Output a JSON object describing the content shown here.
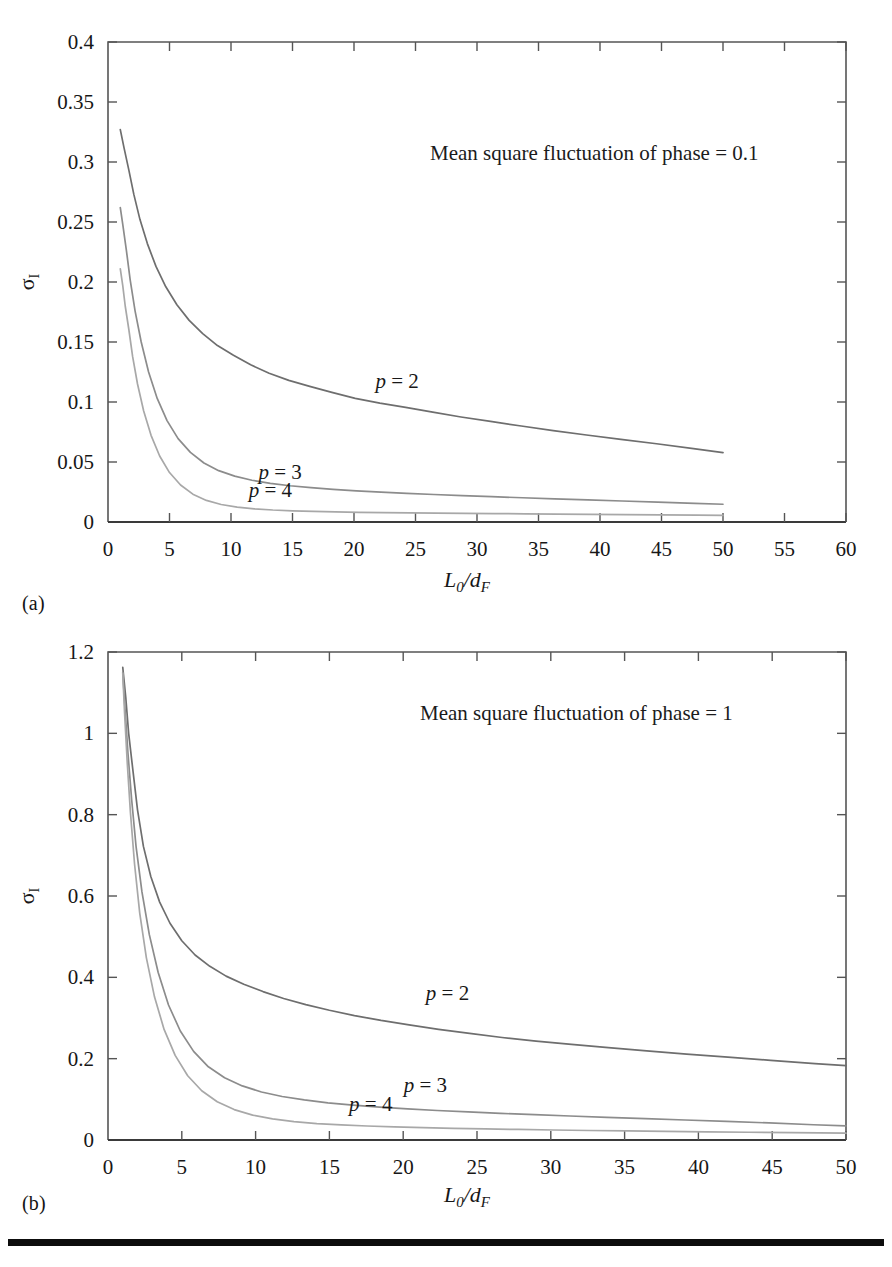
{
  "figure": {
    "panels": [
      {
        "caption": "(a)",
        "annotation": "Mean square fluctuation of phase = 0.1",
        "ylabel": "σ",
        "ylabel_sub": "I",
        "xlabel_main": "L",
        "xlabel_main_sub": "0",
        "xlabel_div": "/",
        "xlabel_den": "d",
        "xlabel_den_sub": "F",
        "series_labels": [
          "p = 2",
          "p = 3",
          "p = 4"
        ]
      },
      {
        "caption": "(b)",
        "annotation": "Mean square fluctuation of phase = 1",
        "ylabel": "σ",
        "ylabel_sub": "I",
        "xlabel_main": "L",
        "xlabel_main_sub": "0",
        "xlabel_div": "/",
        "xlabel_den": "d",
        "xlabel_den_sub": "F",
        "series_labels": [
          "p = 2",
          "p = 3",
          "p = 4"
        ]
      }
    ]
  },
  "chart_data": [
    {
      "type": "line",
      "title": "",
      "annotation": "Mean square fluctuation of phase = 0.1",
      "panel": "(a)",
      "xlabel": "L0/dF",
      "ylabel": "sigma_I",
      "xlim": [
        0,
        60
      ],
      "ylim": [
        0,
        0.4
      ],
      "xticks": [
        0,
        5,
        10,
        15,
        20,
        25,
        30,
        35,
        40,
        45,
        50,
        55,
        60
      ],
      "xtick_labels": [
        "0",
        "5",
        "10",
        "15",
        "20",
        "25",
        "30",
        "35",
        "40",
        "45",
        "50",
        "55",
        "60"
      ],
      "yticks": [
        0,
        0.05,
        0.1,
        0.15,
        0.2,
        0.25,
        0.3,
        0.35,
        0.4
      ],
      "ytick_labels": [
        "0",
        "0.05",
        "0.1",
        "0.15",
        "0.2",
        "0.25",
        "0.3",
        "0.35",
        "0.4"
      ],
      "grid": false,
      "legend_position": "inline-curve-labels",
      "series": [
        {
          "name": "p = 2",
          "color": "#6e6e6e",
          "label_x": 23.5,
          "label_y": 0.112,
          "x": [
            1.0,
            1.3,
            1.7,
            2.1,
            2.6,
            3.2,
            3.9,
            4.7,
            5.6,
            6.6,
            7.7,
            8.9,
            10.2,
            11.6,
            13.1,
            14.7,
            16.4,
            18.2,
            20.1,
            22.1,
            24.2,
            26.4,
            28.7,
            31.1,
            33.6,
            36.2,
            38.9,
            41.7,
            44.6,
            47.6,
            50.0
          ],
          "y": [
            0.327,
            0.312,
            0.293,
            0.273,
            0.252,
            0.232,
            0.213,
            0.196,
            0.181,
            0.168,
            0.157,
            0.147,
            0.139,
            0.131,
            0.124,
            0.118,
            0.113,
            0.108,
            0.103,
            0.099,
            0.0955,
            0.0915,
            0.0875,
            0.0838,
            0.08,
            0.0762,
            0.0725,
            0.0688,
            0.0652,
            0.0612,
            0.0578
          ]
        },
        {
          "name": "p = 3",
          "color": "#8c8c8c",
          "label_x": 14.0,
          "label_y": 0.0355,
          "x": [
            1.0,
            1.2,
            1.5,
            1.8,
            2.2,
            2.7,
            3.3,
            4.0,
            4.8,
            5.7,
            6.7,
            7.8,
            9.0,
            10.3,
            11.7,
            13.2,
            14.8,
            16.5,
            18.3,
            20.2,
            22.2,
            24.3,
            26.5,
            28.8,
            31.2,
            33.7,
            36.3,
            39.0,
            41.8,
            44.7,
            47.7,
            50.0
          ],
          "y": [
            0.262,
            0.248,
            0.226,
            0.202,
            0.176,
            0.15,
            0.125,
            0.103,
            0.0845,
            0.0695,
            0.058,
            0.0492,
            0.0428,
            0.0382,
            0.0348,
            0.0322,
            0.0302,
            0.0286,
            0.0272,
            0.026,
            0.0249,
            0.0239,
            0.0229,
            0.022,
            0.0211,
            0.0202,
            0.0193,
            0.0184,
            0.0175,
            0.0166,
            0.0155,
            0.0148
          ]
        },
        {
          "name": "p = 4",
          "color": "#a8a8a8",
          "label_x": 13.2,
          "label_y": 0.0205,
          "x": [
            1.0,
            1.2,
            1.4,
            1.7,
            2.0,
            2.4,
            2.9,
            3.5,
            4.2,
            5.0,
            5.9,
            6.9,
            8.0,
            9.2,
            10.5,
            11.9,
            13.4,
            15.0,
            16.7,
            18.5,
            20.4,
            22.4,
            24.5,
            26.7,
            29.0,
            31.4,
            33.9,
            36.5,
            39.2,
            42.0,
            44.9,
            47.9,
            50.0
          ],
          "y": [
            0.211,
            0.197,
            0.18,
            0.16,
            0.138,
            0.115,
            0.0925,
            0.0722,
            0.055,
            0.0412,
            0.0308,
            0.0232,
            0.018,
            0.0146,
            0.0124,
            0.011,
            0.01,
            0.0093,
            0.0088,
            0.0084,
            0.0081,
            0.0078,
            0.0076,
            0.0074,
            0.0072,
            0.007,
            0.0068,
            0.0066,
            0.0064,
            0.0062,
            0.006,
            0.0058,
            0.0056
          ]
        }
      ]
    },
    {
      "type": "line",
      "title": "",
      "annotation": "Mean square fluctuation of phase = 1",
      "panel": "(b)",
      "xlabel": "L0/dF",
      "ylabel": "sigma_I",
      "xlim": [
        0,
        50
      ],
      "ylim": [
        0,
        1.2
      ],
      "xticks": [
        0,
        5,
        10,
        15,
        20,
        25,
        30,
        35,
        40,
        45,
        50
      ],
      "xtick_labels": [
        "0",
        "5",
        "10",
        "15",
        "20",
        "25",
        "30",
        "35",
        "40",
        "45",
        "50"
      ],
      "yticks": [
        0,
        0.2,
        0.4,
        0.6,
        0.8,
        1.0,
        1.2
      ],
      "ytick_labels": [
        "0",
        "0.2",
        "0.4",
        "0.6",
        "0.8",
        "1",
        "1.2"
      ],
      "grid": false,
      "legend_position": "inline-curve-labels",
      "series": [
        {
          "name": "p = 2",
          "color": "#6e6e6e",
          "label_x": 23.0,
          "label_y": 0.345,
          "x": [
            1.0,
            1.2,
            1.4,
            1.7,
            2.0,
            2.4,
            2.9,
            3.5,
            4.2,
            5.0,
            5.9,
            6.9,
            8.0,
            9.2,
            10.5,
            11.9,
            13.4,
            15.0,
            16.7,
            18.5,
            20.4,
            22.4,
            24.5,
            26.7,
            29.0,
            31.4,
            33.9,
            36.5,
            39.2,
            42.0,
            44.9,
            47.9,
            50.0
          ],
          "y": [
            1.162,
            1.09,
            1.0,
            0.905,
            0.812,
            0.722,
            0.648,
            0.585,
            0.533,
            0.49,
            0.455,
            0.427,
            0.403,
            0.383,
            0.365,
            0.348,
            0.333,
            0.319,
            0.306,
            0.294,
            0.283,
            0.272,
            0.262,
            0.252,
            0.243,
            0.235,
            0.227,
            0.219,
            0.211,
            0.204,
            0.196,
            0.188,
            0.183
          ]
        },
        {
          "name": "p = 3",
          "color": "#8c8c8c",
          "label_x": 21.5,
          "label_y": 0.118,
          "x": [
            1.0,
            1.15,
            1.35,
            1.6,
            1.9,
            2.3,
            2.8,
            3.4,
            4.1,
            4.9,
            5.8,
            6.8,
            7.9,
            9.1,
            10.4,
            11.8,
            13.3,
            14.9,
            16.6,
            18.4,
            20.3,
            22.3,
            24.4,
            26.6,
            28.9,
            31.3,
            33.8,
            36.4,
            39.1,
            41.9,
            44.8,
            47.8,
            50.0
          ],
          "y": [
            1.15,
            1.062,
            0.952,
            0.838,
            0.722,
            0.61,
            0.505,
            0.412,
            0.332,
            0.268,
            0.218,
            0.18,
            0.153,
            0.133,
            0.118,
            0.107,
            0.0985,
            0.0915,
            0.0858,
            0.0808,
            0.0765,
            0.0725,
            0.069,
            0.0655,
            0.0622,
            0.059,
            0.0558,
            0.0525,
            0.0492,
            0.0458,
            0.042,
            0.0375,
            0.0345
          ]
        },
        {
          "name": "p = 4",
          "color": "#a8a8a8",
          "label_x": 17.8,
          "label_y": 0.072,
          "x": [
            1.0,
            1.12,
            1.3,
            1.52,
            1.8,
            2.15,
            2.6,
            3.15,
            3.8,
            4.55,
            5.4,
            6.35,
            7.4,
            8.55,
            9.8,
            11.15,
            12.6,
            14.15,
            15.8,
            17.55,
            19.4,
            21.35,
            23.4,
            25.55,
            27.8,
            30.15,
            32.6,
            35.15,
            37.8,
            40.55,
            43.4,
            46.35,
            50.0
          ],
          "y": [
            1.148,
            1.052,
            0.93,
            0.805,
            0.678,
            0.558,
            0.448,
            0.352,
            0.272,
            0.208,
            0.158,
            0.121,
            0.094,
            0.0748,
            0.0612,
            0.0518,
            0.0452,
            0.0405,
            0.037,
            0.0344,
            0.0322,
            0.0304,
            0.0288,
            0.0273,
            0.0259,
            0.0246,
            0.0234,
            0.0222,
            0.0211,
            0.02,
            0.019,
            0.018,
            0.0168
          ]
        }
      ]
    }
  ]
}
